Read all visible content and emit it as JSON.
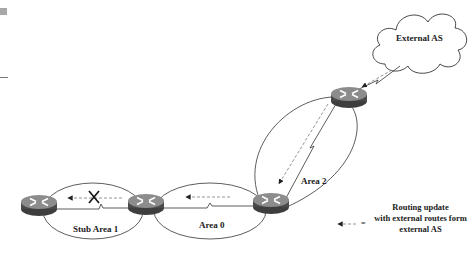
{
  "diagram": {
    "type": "network-topology",
    "cloud": {
      "label": "External AS"
    },
    "areas": [
      {
        "id": "stub-area-1",
        "label": "Stub Area 1"
      },
      {
        "id": "area-0",
        "label": "Area 0"
      },
      {
        "id": "area-2",
        "label": "Area 2"
      }
    ],
    "routers": [
      {
        "id": "r1",
        "role": "stub-internal-router"
      },
      {
        "id": "r2",
        "role": "abr-stub-area0"
      },
      {
        "id": "r3",
        "role": "abr-area0-area2"
      },
      {
        "id": "r4",
        "role": "asbr-area2"
      }
    ],
    "links": [
      {
        "from": "r4",
        "to": "external-as",
        "style": "serial"
      },
      {
        "from": "r4",
        "to": "r3",
        "style": "serial"
      },
      {
        "from": "r3",
        "to": "r2",
        "style": "serial"
      },
      {
        "from": "r2",
        "to": "r1",
        "style": "serial"
      }
    ],
    "flows": [
      {
        "from": "external-as",
        "to": "r4",
        "style": "dashed-arrow"
      },
      {
        "from": "r4",
        "to": "r3",
        "style": "dashed-arrow"
      },
      {
        "from": "r3",
        "to": "r2",
        "style": "dashed-arrow"
      },
      {
        "from": "r2",
        "to": "r1",
        "style": "dashed-arrow",
        "blocked": true,
        "blocked_marker": "X"
      }
    ],
    "legend": {
      "symbol": "dashed-arrow",
      "equals": "=",
      "line1": "Routing update",
      "line2": "with external routes form",
      "line3": "external AS"
    },
    "colors": {
      "line": "#333333",
      "dashed": "#888888",
      "router_top": "#8c8c8c",
      "router_body": "#4a4a4a"
    }
  }
}
